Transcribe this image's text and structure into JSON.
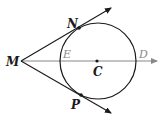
{
  "diagram": {
    "colors": {
      "ink": "#1a1a1a",
      "ray": "#888888"
    },
    "points": {
      "M": "M",
      "N": "N",
      "P": "P",
      "E": "E",
      "C": "C",
      "D": "D"
    }
  }
}
